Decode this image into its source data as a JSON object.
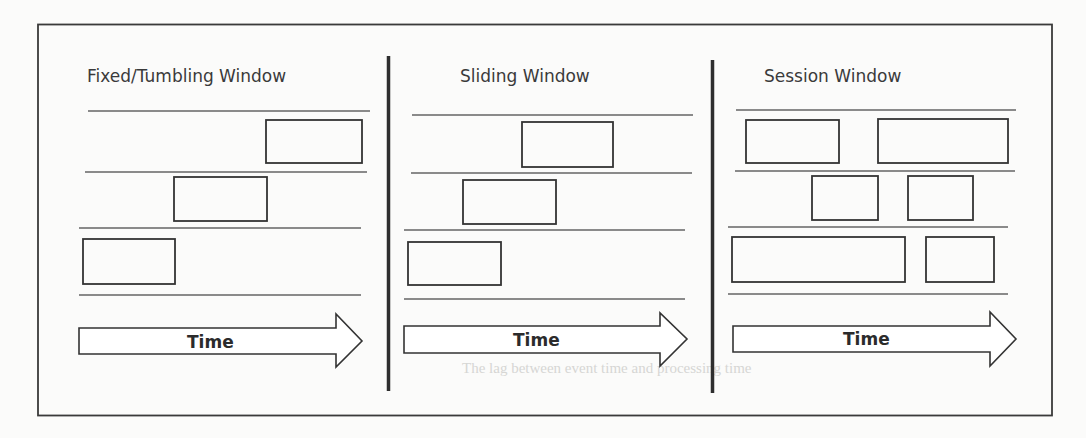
{
  "diagram": {
    "type": "stream-processing-window-types",
    "frame_color": "#3a3a3a",
    "line_color": "#8a8a8a",
    "box_stroke": "#333333",
    "panels": [
      {
        "id": "fixed",
        "title": "Fixed/Tumbling Window",
        "arrow_label": "Time",
        "rows": 3,
        "description": "Non-overlapping, contiguous windows; each window begins where the previous ends"
      },
      {
        "id": "sliding",
        "title": "Sliding Window",
        "arrow_label": "Time",
        "rows": 3,
        "description": "Overlapping windows of equal size, each shifted by a slide interval"
      },
      {
        "id": "session",
        "title": "Session Window",
        "arrow_label": "Time",
        "rows": 3,
        "description": "Variable-length windows separated by gaps of inactivity, per key row"
      }
    ]
  },
  "caption_bleed": "The lag between event time and processing time"
}
